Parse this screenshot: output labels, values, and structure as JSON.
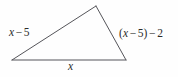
{
  "figure": {
    "type": "triangle-diagram",
    "background_color": "#fefefe",
    "stroke_color": "#55555a",
    "text_color": "#2b2b2b",
    "vertices": {
      "left": [
        12,
        60
      ],
      "apex": [
        96,
        6
      ],
      "right": [
        126,
        60
      ]
    },
    "labels": {
      "left_side": {
        "full_text": "x − 5",
        "variable": "x",
        "operator": "−",
        "constant": "5"
      },
      "right_side": {
        "full_text": "(x − 5) − 2",
        "open_paren": "(",
        "variable": "x",
        "inner_operator": "−",
        "inner_constant": "5",
        "close_paren": ")",
        "outer_operator": "−",
        "outer_constant": "2"
      },
      "bottom_side": {
        "full_text": "x",
        "variable": "x"
      }
    }
  }
}
